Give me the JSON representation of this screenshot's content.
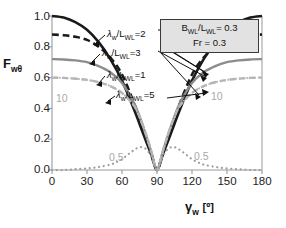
{
  "chart_data": {
    "type": "line",
    "title": "",
    "xlabel": "γ_w [°]",
    "ylabel": "F_wθ",
    "xlim": [
      0,
      180
    ],
    "ylim": [
      0.0,
      1.0
    ],
    "xticks": [
      "0",
      "30",
      "60",
      "90",
      "120",
      "150",
      "180"
    ],
    "yticks": [
      "1.0",
      "0.8",
      "0.6",
      "0.4",
      "0.2",
      "0.0"
    ],
    "grid": false,
    "legend_position": "inside-top-right",
    "series": [
      {
        "name": "λ_w/L_WL=1",
        "label": "λ_w/L_WL=1",
        "style": "solid",
        "color": "#1a1a1a",
        "width": 2.6,
        "x": [
          0,
          10,
          20,
          30,
          40,
          50,
          60,
          70,
          75,
          80,
          85,
          90,
          95,
          100,
          105,
          110,
          120,
          130,
          140,
          150,
          160,
          170,
          180
        ],
        "values": [
          1.0,
          0.99,
          0.96,
          0.91,
          0.83,
          0.72,
          0.58,
          0.4,
          0.3,
          0.2,
          0.1,
          0.0,
          0.1,
          0.2,
          0.3,
          0.4,
          0.58,
          0.72,
          0.83,
          0.91,
          0.96,
          0.99,
          1.0
        ]
      },
      {
        "name": "λ_w/L_WL=2",
        "label": "λ_w/L_WL=2",
        "style": "dashed",
        "color": "#1a1a1a",
        "width": 2.6,
        "x": [
          0,
          10,
          20,
          30,
          40,
          50,
          60,
          70,
          75,
          80,
          85,
          90,
          95,
          100,
          105,
          110,
          120,
          130,
          140,
          150,
          160,
          170,
          180
        ],
        "values": [
          0.88,
          0.875,
          0.865,
          0.845,
          0.8,
          0.73,
          0.62,
          0.44,
          0.33,
          0.22,
          0.11,
          0.0,
          0.11,
          0.22,
          0.33,
          0.44,
          0.62,
          0.73,
          0.8,
          0.845,
          0.865,
          0.875,
          0.88
        ]
      },
      {
        "name": "λ_w/L_WL=3",
        "label": "λ_w/L_WL=3",
        "style": "solid",
        "color": "#8c8c8c",
        "width": 2.4,
        "x": [
          0,
          10,
          20,
          30,
          40,
          50,
          60,
          70,
          75,
          80,
          85,
          90,
          95,
          100,
          105,
          110,
          120,
          130,
          140,
          150,
          160,
          170,
          180
        ],
        "values": [
          0.72,
          0.718,
          0.712,
          0.7,
          0.675,
          0.635,
          0.565,
          0.44,
          0.35,
          0.24,
          0.12,
          0.0,
          0.12,
          0.24,
          0.35,
          0.44,
          0.565,
          0.635,
          0.675,
          0.7,
          0.712,
          0.718,
          0.72
        ]
      },
      {
        "name": "λ_w/L_WL=5",
        "label": "λ_w/L_WL=5",
        "style": "dashed",
        "color": "#b3b3b3",
        "width": 2.4,
        "x": [
          0,
          10,
          20,
          30,
          40,
          50,
          60,
          70,
          75,
          80,
          85,
          90,
          95,
          100,
          105,
          110,
          120,
          130,
          140,
          150,
          160,
          170,
          180
        ],
        "values": [
          0.6,
          0.598,
          0.593,
          0.585,
          0.57,
          0.545,
          0.5,
          0.42,
          0.345,
          0.245,
          0.125,
          0.0,
          0.125,
          0.245,
          0.345,
          0.42,
          0.5,
          0.545,
          0.57,
          0.585,
          0.593,
          0.598,
          0.6
        ]
      },
      {
        "name": "10",
        "label": "10",
        "style": "dotted-fine",
        "color": "#b8b8b8",
        "width": 2.2,
        "x": [
          0,
          10,
          20,
          30,
          40,
          50,
          60,
          70,
          75,
          80,
          85,
          90,
          95,
          100,
          105,
          110,
          120,
          130,
          140,
          150,
          160,
          170,
          180
        ],
        "values": [
          0.6,
          0.598,
          0.593,
          0.585,
          0.57,
          0.545,
          0.5,
          0.42,
          0.345,
          0.245,
          0.125,
          0.0,
          0.125,
          0.245,
          0.345,
          0.42,
          0.5,
          0.545,
          0.57,
          0.585,
          0.593,
          0.598,
          0.6
        ]
      },
      {
        "name": "0.5",
        "label": "0.5",
        "style": "dotted",
        "color": "#9e9e9e",
        "width": 2.2,
        "x": [
          0,
          10,
          20,
          30,
          40,
          50,
          55,
          60,
          65,
          70,
          75,
          80,
          85,
          90,
          95,
          100,
          105,
          110,
          115,
          120,
          125,
          130,
          140,
          150,
          160,
          170,
          180
        ],
        "values": [
          0.0,
          0.0,
          0.005,
          0.01,
          0.02,
          0.035,
          0.05,
          0.07,
          0.1,
          0.128,
          0.148,
          0.14,
          0.09,
          0.0,
          0.09,
          0.14,
          0.148,
          0.128,
          0.1,
          0.07,
          0.05,
          0.035,
          0.02,
          0.01,
          0.005,
          0.0,
          0.0
        ]
      }
    ],
    "inline_labels": [
      {
        "text": "10",
        "x": 33,
        "y": 0.465
      },
      {
        "text": "10",
        "x": 147,
        "y": 0.47
      },
      {
        "text": "0.5",
        "x": 73,
        "y": 0.075
      },
      {
        "text": "0.5",
        "x": 130,
        "y": 0.095
      }
    ],
    "annotations": [
      {
        "text": "λ_w/L_WL=2"
      },
      {
        "text": "λ_w/L_WL=3"
      },
      {
        "text": "λ_w/L_WL=1"
      },
      {
        "text": "λ_w/L_WL=5"
      }
    ],
    "legend_box": {
      "line1": "B_WL/L_WL= 0.3",
      "line2": "Fr = 0.3"
    }
  },
  "axes": {
    "ylabel_main": "F",
    "ylabel_sub": "wθ",
    "xlabel_main": "γ",
    "xlabel_sub": "w",
    "xlabel_unit": "[º]",
    "yticks": [
      "1.0",
      "0.8",
      "0.6",
      "0.4",
      "0.2",
      "0.0"
    ],
    "xticks": [
      "0",
      "30",
      "60",
      "90",
      "120",
      "150",
      "180"
    ]
  },
  "labels": {
    "lam": "λ",
    "slash": "/L",
    "sub_w": "w",
    "sub_wl": "WL",
    "eq2": "=2",
    "eq3": "=3",
    "eq1": "=1",
    "eq5": "=5",
    "gray10_left": "10",
    "gray10_right": "10",
    "gray05_left": "0.5",
    "gray05_right": "0.5"
  },
  "legend": {
    "b_main": "B",
    "b_sub": "WL",
    "l_main": "/L",
    "l_sub": "WL",
    "b_val": "= 0.3",
    "fr_text": "Fr = 0.3"
  }
}
